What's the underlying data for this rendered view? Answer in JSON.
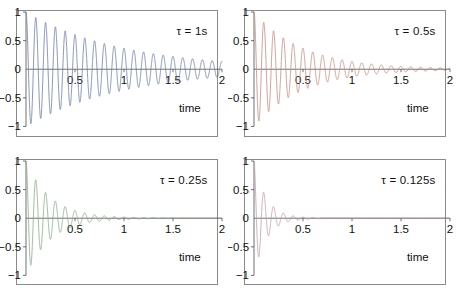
{
  "figure": {
    "title": "",
    "background": "#ffffff",
    "panel_border_color": "#8a8a8a",
    "axis_color": "#333333",
    "text_color": "#111111"
  },
  "chart_data": [
    {
      "type": "line",
      "title": "",
      "annotation": "τ = 1s",
      "tau": 1,
      "omega_hz": 10,
      "xlabel": "time",
      "ylabel": "",
      "xlim": [
        0,
        2
      ],
      "ylim": [
        -1,
        1
      ],
      "grid": false,
      "color": "#6b7ba6",
      "xticks": [
        "0.5",
        "1",
        "1.5",
        "2"
      ],
      "xtick_values": [
        0.5,
        1,
        1.5,
        2
      ],
      "yticks": [
        "1",
        "0.5",
        "0",
        "−0.5",
        "−1"
      ],
      "ytick_values": [
        1,
        0.5,
        0,
        -0.5,
        -1
      ],
      "equation": "exp(-t/tau)*cos(2*pi*10*t)"
    },
    {
      "type": "line",
      "title": "",
      "annotation": "τ = 0.5s",
      "tau": 0.5,
      "omega_hz": 10,
      "xlabel": "time",
      "ylabel": "",
      "xlim": [
        0,
        2
      ],
      "ylim": [
        -1,
        1
      ],
      "grid": false,
      "color": "#c48a7e",
      "xticks": [
        "0.5",
        "1",
        "1.5",
        "2"
      ],
      "xtick_values": [
        0.5,
        1,
        1.5,
        2
      ],
      "yticks": [
        "1",
        "0.5",
        "0",
        "−0.5",
        "−1"
      ],
      "ytick_values": [
        1,
        0.5,
        0,
        -0.5,
        -1
      ],
      "equation": "exp(-t/tau)*cos(2*pi*10*t)"
    },
    {
      "type": "line",
      "title": "",
      "annotation": "τ = 0.25s",
      "tau": 0.25,
      "omega_hz": 10,
      "xlabel": "time",
      "ylabel": "",
      "xlim": [
        0,
        2
      ],
      "ylim": [
        -1,
        1
      ],
      "grid": false,
      "color": "#86ab86",
      "xticks": [
        "0.5",
        "1",
        "1.5",
        "2"
      ],
      "xtick_values": [
        0.5,
        1,
        1.5,
        2
      ],
      "yticks": [
        "1",
        "0.5",
        "0",
        "−0.5",
        "−1"
      ],
      "ytick_values": [
        1,
        0.5,
        0,
        -0.5,
        -1
      ],
      "equation": "exp(-t/tau)*cos(2*pi*10*t)"
    },
    {
      "type": "line",
      "title": "",
      "annotation": "τ = 0.125s",
      "tau": 0.125,
      "omega_hz": 10,
      "xlabel": "time",
      "ylabel": "",
      "xlim": [
        0,
        2
      ],
      "ylim": [
        -1,
        1
      ],
      "grid": false,
      "color": "#c49aa8",
      "xticks": [
        "0.5",
        "1",
        "1.5",
        "2"
      ],
      "xtick_values": [
        0.5,
        1,
        1.5,
        2
      ],
      "yticks": [
        "1",
        "0.5",
        "0",
        "−0.5",
        "−1"
      ],
      "ytick_values": [
        1,
        0.5,
        0,
        -0.5,
        -1
      ],
      "equation": "exp(-t/tau)*cos(2*pi*10*t)"
    }
  ]
}
